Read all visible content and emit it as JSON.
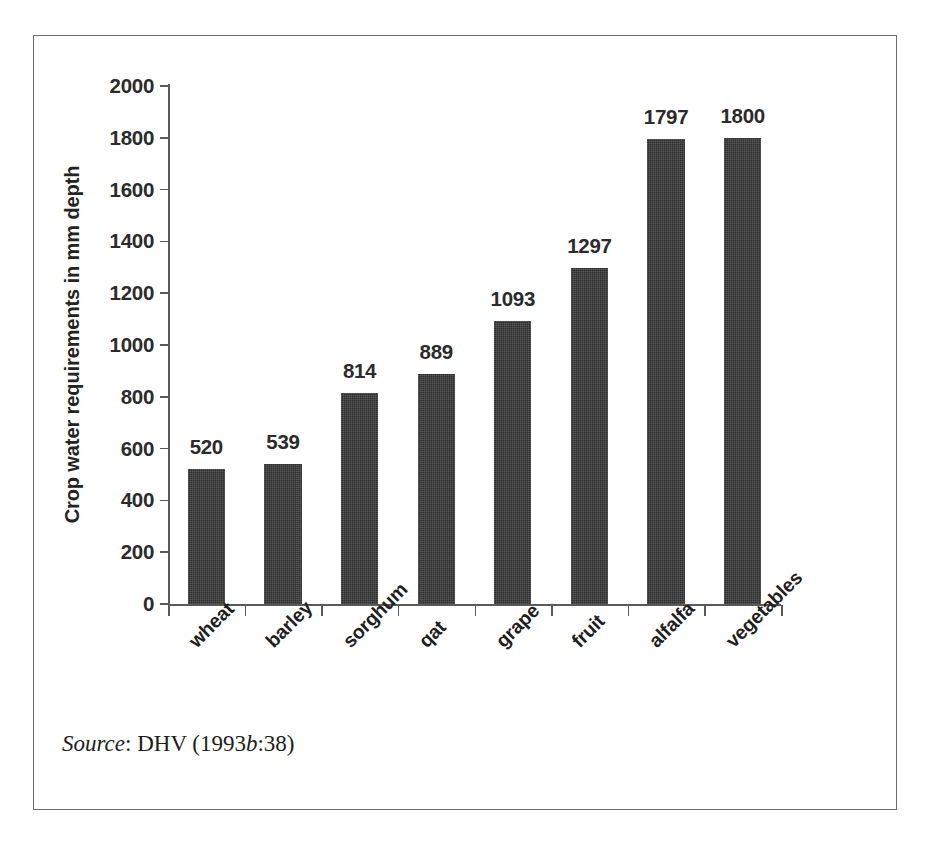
{
  "figure": {
    "source_prefix": "Source",
    "source_separator": ": DHV (1993",
    "source_italic_letter": "b",
    "source_suffix": ":38)"
  },
  "chart_data": {
    "type": "bar",
    "title": "",
    "xlabel": "",
    "ylabel": "Crop water requirements in mm depth",
    "ylim": [
      0,
      2000
    ],
    "ytick_interval": 200,
    "yticks": [
      0,
      200,
      400,
      600,
      800,
      1000,
      1200,
      1400,
      1600,
      1800,
      2000
    ],
    "ytick_labels": [
      "0",
      "200",
      "400",
      "600",
      "800",
      "1000",
      "1200",
      "1400",
      "1600",
      "1800",
      "2000"
    ],
    "categories": [
      "wheat",
      "barley",
      "sorghum",
      "qat",
      "grape",
      "fruit",
      "alfalfa",
      "vegetables"
    ],
    "values": [
      520,
      539,
      814,
      889,
      1093,
      1297,
      1797,
      1800
    ],
    "value_labels": [
      "520",
      "539",
      "814",
      "889",
      "1093",
      "1297",
      "1797",
      "1800"
    ],
    "grid": false,
    "legend": false,
    "bar_color": "#2e2e2e",
    "axis_color": "#5a5a5a",
    "text_color": "#2b2b2b",
    "category_label_rotation": -45,
    "data_labels_position": "above-bar"
  }
}
